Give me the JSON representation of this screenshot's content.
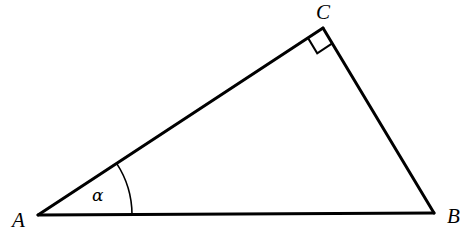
{
  "figure": {
    "kind": "right-triangle-diagram",
    "background_color": "#ffffff",
    "stroke_color": "#000000",
    "stroke_width": 3,
    "width": 466,
    "height": 231
  },
  "vertices": {
    "A": {
      "label": "A",
      "x": 38,
      "y": 215,
      "label_x": 12,
      "label_y": 227
    },
    "B": {
      "label": "B",
      "x": 434,
      "y": 213,
      "label_x": 447,
      "label_y": 223
    },
    "C": {
      "label": "C",
      "x": 323,
      "y": 28,
      "label_x": 316,
      "label_y": 19
    }
  },
  "sides": [
    {
      "name": "AB",
      "from": "A",
      "to": "B"
    },
    {
      "name": "AC",
      "from": "A",
      "to": "C"
    },
    {
      "name": "CB",
      "from": "C",
      "to": "B"
    }
  ],
  "angles": {
    "alpha": {
      "label": "α",
      "at_vertex": "A",
      "arc_radius": 94,
      "label_x": 92,
      "label_y": 201,
      "arc_path": "M 126.4 171.4 A 94 94 0 0 1 132 214.8"
    },
    "right_angle": {
      "label": "",
      "at_vertex": "C",
      "marker": "square",
      "marker_size": 18,
      "marker_path": "M 306.6 38.8 L 317.3 56.2 L 334.9 45.8 L 323 28"
    }
  },
  "geometry_notes": {
    "triangle_name": "ABC",
    "right_angle_vertex": "C",
    "labeled_angle_vertex": "A",
    "labeled_angle_symbol": "α"
  }
}
